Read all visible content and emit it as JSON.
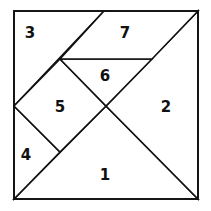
{
  "diagram": {
    "type": "tangram-square",
    "stroke_color": "#111111",
    "fill_color": "#ffffff",
    "pieces": [
      {
        "id": "1",
        "label": "1",
        "shape": "large-triangle"
      },
      {
        "id": "2",
        "label": "2",
        "shape": "large-triangle"
      },
      {
        "id": "3",
        "label": "3",
        "shape": "medium-triangle"
      },
      {
        "id": "4",
        "label": "4",
        "shape": "small-triangle"
      },
      {
        "id": "5",
        "label": "5",
        "shape": "square"
      },
      {
        "id": "6",
        "label": "6",
        "shape": "small-triangle"
      },
      {
        "id": "7",
        "label": "7",
        "shape": "parallelogram"
      }
    ]
  }
}
